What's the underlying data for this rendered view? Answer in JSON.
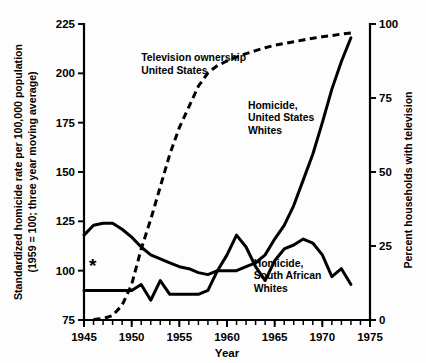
{
  "chart_data": {
    "type": "line",
    "title": "",
    "xlabel": "Year",
    "ylabel": "Standardized homicide rate per 100,000 population (1959 = 100; three year moving average)",
    "ylabel_line1": "Standardized homicide rate per 100,000 population",
    "ylabel_line2": "(1959 = 100; three year moving average)",
    "y2label": "Percent households with television",
    "xlim": [
      1945,
      1975
    ],
    "ylim": [
      75,
      225
    ],
    "y2lim": [
      0,
      100
    ],
    "grid": false,
    "legend": "annotations on plot",
    "xticks": [
      1945,
      1950,
      1955,
      1960,
      1965,
      1970,
      1975
    ],
    "xticklabels": [
      "1945",
      "1950",
      "1955",
      "1960",
      "1965",
      "1970",
      "1975"
    ],
    "xminortick_step": 1,
    "yticks": [
      75,
      100,
      125,
      150,
      175,
      200,
      225
    ],
    "yticklabels": [
      "75",
      "100",
      "125",
      "150",
      "175",
      "200",
      "225"
    ],
    "y2ticks": [
      0,
      25,
      50,
      75,
      100
    ],
    "y2ticklabels": [
      "0",
      "25",
      "50",
      "75",
      "100"
    ],
    "annotations": [
      {
        "name": "television-ownership-label",
        "lines": [
          "Television ownership",
          "United States"
        ],
        "x": 1951.0,
        "y": 206.0
      },
      {
        "name": "us-homicide-label",
        "lines": [
          "Homicide,",
          "United States",
          "Whites"
        ],
        "x": 1962.2,
        "y": 182.0
      },
      {
        "name": "south-african-homicide-label",
        "lines": [
          "Homicide,",
          "South African",
          "Whites"
        ],
        "x": 1962.8,
        "y": 102.0
      }
    ],
    "marker_asterisk": {
      "name": "asterisk-marker",
      "symbol": "*",
      "x": 1945.9,
      "y": 99.5
    },
    "series": [
      {
        "name": "Television ownership United States",
        "axis": "right",
        "style": "dashed",
        "x": [
          1946,
          1947,
          1948,
          1949,
          1950,
          1951,
          1952,
          1953,
          1954,
          1955,
          1956,
          1957,
          1958,
          1959,
          1960,
          1961,
          1962,
          1963,
          1964,
          1965,
          1966,
          1967,
          1968,
          1969,
          1970,
          1971,
          1972,
          1973
        ],
        "values": [
          0.2,
          0.5,
          1.5,
          5.0,
          12.0,
          24.0,
          34.0,
          45.0,
          56.0,
          65.0,
          72.0,
          79.0,
          83.5,
          86.0,
          87.5,
          88.8,
          90.0,
          91.0,
          92.0,
          92.8,
          93.4,
          94.0,
          94.6,
          95.2,
          95.7,
          96.1,
          96.6,
          97.0
        ]
      },
      {
        "name": "Homicide, United States Whites",
        "axis": "left",
        "style": "solid",
        "x": [
          1945,
          1946,
          1947,
          1948,
          1949,
          1950,
          1951,
          1952,
          1953,
          1954,
          1955,
          1956,
          1957,
          1958,
          1959,
          1960,
          1961,
          1962,
          1963,
          1964,
          1965,
          1966,
          1967,
          1968,
          1969,
          1970,
          1971,
          1972,
          1973
        ],
        "values": [
          118,
          123,
          124,
          124,
          121,
          117,
          112,
          108,
          106,
          104,
          102,
          101,
          99,
          98,
          100,
          100,
          100,
          102,
          104,
          108,
          116,
          123,
          133,
          146,
          159,
          175,
          192,
          206,
          218
        ]
      },
      {
        "name": "Homicide, South African Whites",
        "axis": "left",
        "style": "solid",
        "x": [
          1945,
          1946,
          1947,
          1948,
          1949,
          1950,
          1951,
          1952,
          1953,
          1954,
          1955,
          1956,
          1957,
          1958,
          1959,
          1960,
          1961,
          1962,
          1963,
          1964,
          1965,
          1966,
          1967,
          1968,
          1969,
          1970,
          1971,
          1972,
          1973
        ],
        "values": [
          90,
          90,
          90,
          90,
          90,
          90,
          93,
          85,
          95,
          88,
          88,
          88,
          88,
          90,
          100,
          108,
          118,
          112,
          102,
          95,
          105,
          111,
          113,
          116,
          114,
          108,
          97,
          101,
          93
        ]
      }
    ]
  },
  "geometry": {
    "plot_left": 84,
    "plot_right": 370,
    "plot_top": 24,
    "plot_bottom": 320
  }
}
